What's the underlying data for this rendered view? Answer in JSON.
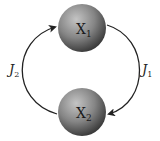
{
  "diagram": {
    "nodes": [
      {
        "id": "x1",
        "label": "X",
        "subscript": "1"
      },
      {
        "id": "x2",
        "label": "X",
        "subscript": "2"
      }
    ],
    "edges": [
      {
        "from": "x1",
        "to": "x2",
        "label": "J",
        "subscript": "1",
        "side": "right"
      },
      {
        "from": "x2",
        "to": "x1",
        "label": "J",
        "subscript": "2",
        "side": "left"
      }
    ],
    "colors": {
      "sphere_light": "#b5b5b5",
      "sphere_dark": "#3a3a3a",
      "arrow": "#222222"
    }
  }
}
